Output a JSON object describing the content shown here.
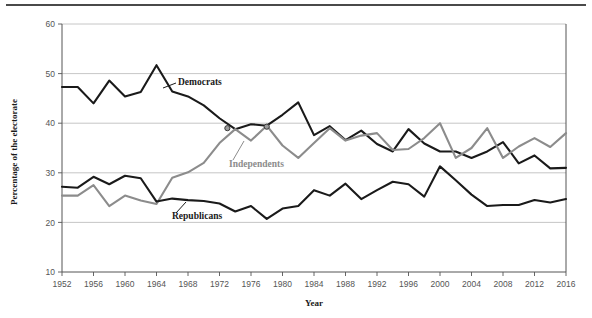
{
  "figure": {
    "background_color": "#ffffff",
    "top_rule_color": "#4a4a4a"
  },
  "chart_data": {
    "type": "line",
    "title": "",
    "subtitle": "",
    "xlabel": "Year",
    "ylabel": "Percentage of the electorate",
    "xlim": [
      1952,
      2016
    ],
    "ylim": [
      10,
      60
    ],
    "grid": "horizontal",
    "legend_position": "inline-annotations",
    "xticks": [
      1952,
      1956,
      1960,
      1964,
      1968,
      1972,
      1976,
      1980,
      1984,
      1988,
      1992,
      1996,
      2000,
      2004,
      2008,
      2012,
      2016
    ],
    "xtick_labels": [
      "1952",
      "1956",
      "1960",
      "1964",
      "1968",
      "1972",
      "1976",
      "1980",
      "1984",
      "1988",
      "1992",
      "1996",
      "2000",
      "2004",
      "2008",
      "2012",
      "2016"
    ],
    "yticks": [
      10,
      20,
      30,
      40,
      50,
      60
    ],
    "ytick_labels": [
      "10",
      "20",
      "30",
      "40",
      "50",
      "60"
    ],
    "x": [
      1952,
      1954,
      1956,
      1958,
      1960,
      1962,
      1964,
      1966,
      1968,
      1970,
      1972,
      1974,
      1976,
      1978,
      1980,
      1982,
      1984,
      1986,
      1988,
      1990,
      1992,
      1994,
      1996,
      1998,
      2000,
      2002,
      2004,
      2006,
      2008,
      2010,
      2012,
      2014,
      2016
    ],
    "series": [
      {
        "name": "Democrats",
        "color": "#1a1a1a",
        "label": "Democrats",
        "label_x": 1966,
        "label_y": 47.2,
        "values": [
          47.3,
          47.3,
          44.0,
          48.6,
          45.4,
          46.3,
          51.7,
          46.4,
          45.4,
          43.6,
          41.0,
          38.8,
          39.8,
          39.5,
          41.7,
          44.2,
          37.6,
          39.4,
          36.6,
          38.5,
          35.8,
          34.3,
          38.8,
          35.9,
          34.3,
          34.3,
          33.0,
          34.3,
          36.2,
          31.9,
          33.5,
          30.9,
          31.0
        ]
      },
      {
        "name": "Independents",
        "color": "#8c8c8c",
        "label": "Independents",
        "label_x": 1972,
        "label_y": 30.6,
        "values": [
          25.4,
          25.4,
          27.5,
          23.3,
          25.4,
          24.4,
          23.7,
          29.0,
          30.1,
          32.0,
          36.0,
          38.8,
          36.5,
          39.5,
          35.5,
          33.0,
          36.0,
          39.0,
          36.5,
          37.5,
          38.0,
          34.6,
          34.8,
          37.0,
          40.0,
          33.0,
          35.0,
          39.0,
          33.0,
          35.3,
          37.0,
          35.2,
          38.0
        ]
      },
      {
        "name": "Republicans",
        "color": "#1a1a1a",
        "label": "Republicans",
        "label_x": 1968,
        "label_y": 21.5,
        "values": [
          27.2,
          27.0,
          29.2,
          27.7,
          29.4,
          28.9,
          24.2,
          24.8,
          24.5,
          24.3,
          23.8,
          22.2,
          23.3,
          20.7,
          22.8,
          23.3,
          26.5,
          25.4,
          27.8,
          24.7,
          26.5,
          28.2,
          27.7,
          25.2,
          31.3,
          28.5,
          25.6,
          23.3,
          23.5,
          23.5,
          24.5,
          24.0,
          24.7
        ]
      }
    ],
    "markers": [
      {
        "x": 1973,
        "y": 39.0,
        "color": "#555555"
      },
      {
        "x": 1978,
        "y": 39.3,
        "color": "#555555"
      }
    ]
  }
}
